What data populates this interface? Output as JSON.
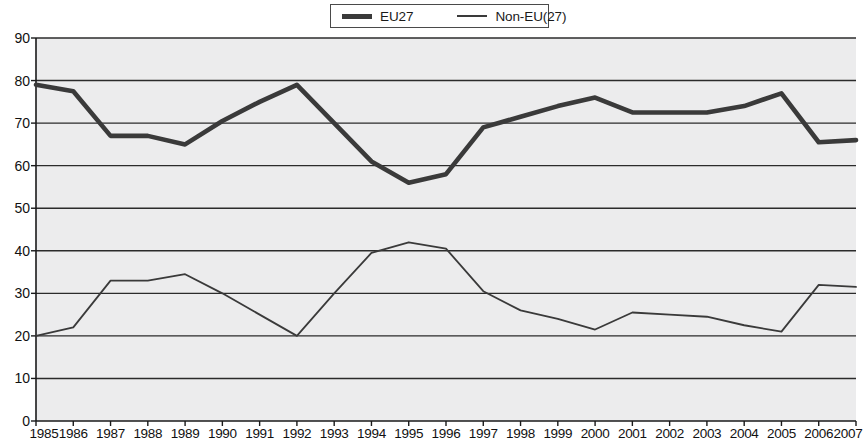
{
  "legend": {
    "position": "top-center",
    "entries": [
      {
        "label": "EU27",
        "style": "thick",
        "color": "#3a3a3a"
      },
      {
        "label": "Non-EU(27)",
        "style": "thin",
        "color": "#3a3a3a"
      }
    ]
  },
  "colors": {
    "plot_background": "#ececed",
    "gridline": "#2b2b2b",
    "axis": "#1a1a1a",
    "series_eu27": "#3a3a3a",
    "series_non_eu": "#3a3a3a",
    "text": "#111111"
  },
  "chart_data": {
    "type": "line",
    "title": "",
    "subtitle": "",
    "xlabel": "",
    "ylabel": "",
    "xlim": [
      1985,
      2007
    ],
    "ylim": [
      0,
      90
    ],
    "ytick_step": 10,
    "grid": true,
    "legend_position": "top-center",
    "categories": [
      "1985",
      "1986",
      "1987",
      "1988",
      "1989",
      "1990",
      "1991",
      "1992",
      "1993",
      "1994",
      "1995",
      "1996",
      "1997",
      "1998",
      "1999",
      "2000",
      "2001",
      "2002",
      "2003",
      "2004",
      "2005",
      "2006",
      "2007"
    ],
    "yticks": [
      0,
      10,
      20,
      30,
      40,
      50,
      60,
      70,
      80,
      90
    ],
    "series": [
      {
        "name": "EU27",
        "style": "thick",
        "values": [
          79,
          77.5,
          67,
          67,
          65,
          70.5,
          75,
          79,
          70,
          61,
          56,
          58,
          69,
          71.5,
          74,
          76,
          72.5,
          72.5,
          72.5,
          74,
          77,
          65.5,
          66
        ]
      },
      {
        "name": "Non-EU(27)",
        "style": "thin",
        "values": [
          20,
          22,
          33,
          33,
          34.5,
          30,
          25,
          20,
          30,
          39.5,
          42,
          40.5,
          30.5,
          26,
          24,
          21.5,
          25.5,
          25,
          24.5,
          22.5,
          21,
          32,
          31.5
        ]
      }
    ]
  }
}
